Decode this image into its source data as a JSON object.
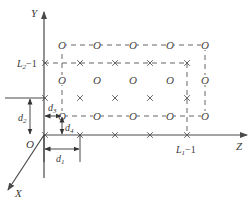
{
  "diagram": {
    "axes": {
      "y_label": "Y",
      "z_label": "Z",
      "x_label": "X",
      "origin_label": "O"
    },
    "tick_labels": {
      "y_tick": "L2−1",
      "y_tick_main": "L",
      "y_tick_sub": "2",
      "y_tick_suffix": "−1",
      "z_tick": "L1−1",
      "z_tick_main": "L",
      "z_tick_sub": "1",
      "z_tick_suffix": "−1"
    },
    "dimensions": {
      "d1": {
        "main": "d",
        "sub": "1"
      },
      "d2": {
        "main": "d",
        "sub": "2"
      },
      "d3": {
        "main": "d",
        "sub": "3"
      },
      "d4": {
        "main": "d",
        "sub": "4"
      }
    },
    "markers": {
      "circle_symbol": "O",
      "cross_symbol": "×"
    },
    "lattice_O": {
      "rows_y": [
        45,
        80,
        116
      ],
      "cols_x": [
        62,
        97,
        133,
        170,
        205
      ]
    },
    "lattice_X": {
      "rows_y": [
        63,
        98,
        135
      ],
      "cols_x": [
        45,
        80,
        115,
        150,
        187
      ]
    },
    "colors": {
      "line": "#4a4a4a",
      "text": "#3a3a3a",
      "background": "#ffffff"
    }
  }
}
